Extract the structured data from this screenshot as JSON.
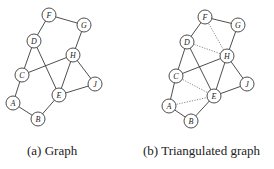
{
  "figures": [
    {
      "id": "a",
      "caption": "(a) Graph",
      "nodes": [
        {
          "label": "F",
          "x": 49,
          "y": 15
        },
        {
          "label": "G",
          "x": 84,
          "y": 25
        },
        {
          "label": "D",
          "x": 34,
          "y": 41
        },
        {
          "label": "H",
          "x": 73,
          "y": 55
        },
        {
          "label": "C",
          "x": 22,
          "y": 75
        },
        {
          "label": "J",
          "x": 95,
          "y": 84
        },
        {
          "label": "E",
          "x": 59,
          "y": 95
        },
        {
          "label": "A",
          "x": 13,
          "y": 103
        },
        {
          "label": "B",
          "x": 38,
          "y": 119
        }
      ],
      "edges": [
        {
          "from": "F",
          "to": "G",
          "style": "solid"
        },
        {
          "from": "F",
          "to": "D",
          "style": "solid"
        },
        {
          "from": "G",
          "to": "H",
          "style": "solid"
        },
        {
          "from": "D",
          "to": "C",
          "style": "solid"
        },
        {
          "from": "D",
          "to": "E",
          "style": "solid"
        },
        {
          "from": "C",
          "to": "H",
          "style": "solid"
        },
        {
          "from": "C",
          "to": "A",
          "style": "solid"
        },
        {
          "from": "H",
          "to": "E",
          "style": "solid"
        },
        {
          "from": "H",
          "to": "J",
          "style": "solid"
        },
        {
          "from": "E",
          "to": "J",
          "style": "solid"
        },
        {
          "from": "E",
          "to": "B",
          "style": "solid"
        },
        {
          "from": "A",
          "to": "B",
          "style": "solid"
        }
      ]
    },
    {
      "id": "b",
      "caption": "(b) Triangulated graph",
      "nodes": [
        {
          "label": "F",
          "x": 205,
          "y": 17
        },
        {
          "label": "G",
          "x": 238,
          "y": 25
        },
        {
          "label": "D",
          "x": 187,
          "y": 42
        },
        {
          "label": "H",
          "x": 227,
          "y": 56
        },
        {
          "label": "C",
          "x": 176,
          "y": 76
        },
        {
          "label": "J",
          "x": 247,
          "y": 84
        },
        {
          "label": "E",
          "x": 214,
          "y": 96
        },
        {
          "label": "A",
          "x": 169,
          "y": 106
        },
        {
          "label": "B",
          "x": 191,
          "y": 121
        }
      ],
      "edges": [
        {
          "from": "F",
          "to": "G",
          "style": "solid"
        },
        {
          "from": "F",
          "to": "D",
          "style": "solid"
        },
        {
          "from": "G",
          "to": "H",
          "style": "solid"
        },
        {
          "from": "D",
          "to": "C",
          "style": "solid"
        },
        {
          "from": "D",
          "to": "E",
          "style": "solid"
        },
        {
          "from": "C",
          "to": "H",
          "style": "solid"
        },
        {
          "from": "C",
          "to": "A",
          "style": "solid"
        },
        {
          "from": "H",
          "to": "E",
          "style": "solid"
        },
        {
          "from": "H",
          "to": "J",
          "style": "solid"
        },
        {
          "from": "E",
          "to": "J",
          "style": "solid"
        },
        {
          "from": "E",
          "to": "B",
          "style": "solid"
        },
        {
          "from": "A",
          "to": "B",
          "style": "solid"
        },
        {
          "from": "F",
          "to": "H",
          "style": "dotted"
        },
        {
          "from": "D",
          "to": "H",
          "style": "dotted"
        },
        {
          "from": "C",
          "to": "E",
          "style": "dotted"
        },
        {
          "from": "A",
          "to": "E",
          "style": "dotted"
        }
      ]
    }
  ]
}
